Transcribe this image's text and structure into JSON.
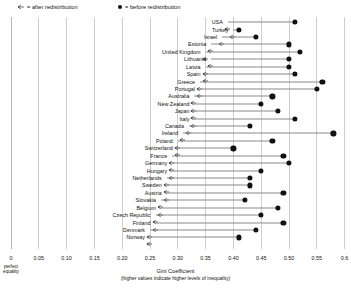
{
  "legend": {
    "after": {
      "label": "= after redistribution",
      "icon": "left-arrow-icon"
    },
    "before": {
      "label": "= before redistribution",
      "icon": "filled-circle-icon"
    }
  },
  "axis": {
    "title": "Gini Coefficient",
    "subtitle": "(higher values indicate higher levels of inequality)",
    "origin_note_line1": "perfect",
    "origin_note_line2": "equality",
    "ticks": [
      "0",
      "0.05",
      "0.10",
      "0.15",
      "0.20",
      "0.25",
      "0.30",
      "0.35",
      "0.40",
      "0.45",
      "0.50",
      "0.55",
      "0.6"
    ],
    "tick_values": [
      0,
      0.05,
      0.1,
      0.15,
      0.2,
      0.25,
      0.3,
      0.35,
      0.4,
      0.45,
      0.5,
      0.55,
      0.6
    ]
  },
  "chart_data": {
    "type": "bar",
    "subtype": "dumbbell-arrow",
    "title": "",
    "xlabel": "Gini Coefficient",
    "ylabel": "",
    "xlim": [
      0,
      0.6
    ],
    "grid": true,
    "legend_position": "top-left",
    "categories": [
      "USA",
      "Turkey",
      "Israel",
      "Estonia",
      "United Kingdom",
      "Lithuania",
      "Latvia",
      "Spain",
      "Greece",
      "Portugal",
      "Australia",
      "New Zealand",
      "Japan",
      "Italy",
      "Canada",
      "Ireland",
      "Poland",
      "Switzerland",
      "France",
      "Germany",
      "Hungary",
      "Netherlands",
      "Sweden",
      "Austria",
      "Slovakia",
      "Belgium",
      "Czech Republic",
      "Finland",
      "Denmark",
      "Norway"
    ],
    "series": [
      {
        "name": "before redistribution",
        "marker": "filled-circle",
        "values": [
          0.51,
          0.41,
          0.44,
          0.5,
          0.52,
          0.5,
          0.5,
          0.51,
          0.56,
          0.55,
          0.47,
          0.45,
          0.48,
          0.51,
          0.43,
          0.58,
          0.47,
          0.4,
          0.49,
          0.5,
          0.45,
          0.43,
          0.43,
          0.49,
          0.42,
          0.48,
          0.45,
          0.49,
          0.44,
          0.41
        ]
      },
      {
        "name": "after redistribution",
        "marker": "left-arrow",
        "values": [
          0.39,
          0.4,
          0.38,
          0.36,
          0.35,
          0.36,
          0.35,
          0.35,
          0.34,
          0.34,
          0.33,
          0.33,
          0.33,
          0.33,
          0.32,
          0.31,
          0.3,
          0.3,
          0.29,
          0.29,
          0.29,
          0.28,
          0.28,
          0.28,
          0.27,
          0.27,
          0.26,
          0.26,
          0.25,
          0.25
        ]
      }
    ]
  }
}
